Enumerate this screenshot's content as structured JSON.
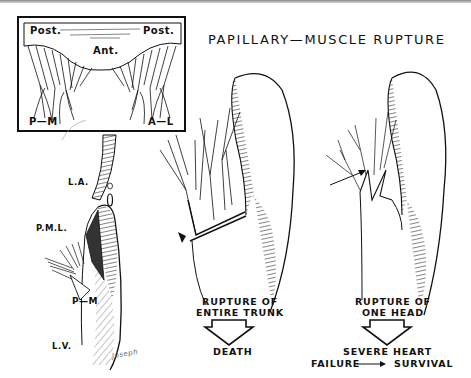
{
  "figure": {
    "title": "PAPILLARY—MUSCLE RUPTURE",
    "inset": {
      "labels": {
        "post_left": "Post.",
        "post_right": "Post.",
        "ant": "Ant.",
        "pm": "P—M",
        "al": "A—L"
      }
    },
    "left_panel": {
      "labels": {
        "la": "L.A.",
        "pml": "P.M.L.",
        "pm": "P—M",
        "lv": "L.V."
      },
      "signature": "Joseph"
    },
    "middle_panel": {
      "caption_line1": "RUPTURE OF",
      "caption_line2": "ENTIRE TRUNK",
      "outcome": "DEATH"
    },
    "right_panel": {
      "caption_line1": "RUPTURE OF",
      "caption_line2": "ONE HEAD",
      "outcome_line1": "SEVERE HEART",
      "outcome_failure": "FAILURE",
      "outcome_survival": "SURVIVAL"
    }
  },
  "colors": {
    "ink": "#111111",
    "background": "#ffffff"
  }
}
